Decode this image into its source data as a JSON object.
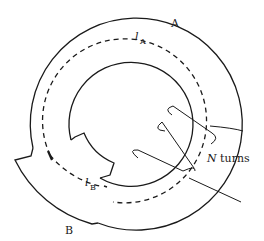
{
  "figure": {
    "type": "magnetic-circuit",
    "labels": {
      "region_a": "A",
      "region_b": "B",
      "path_a_symbol": "l",
      "path_a_sub": "A",
      "path_b_symbol": "l",
      "path_b_sub": "B",
      "coil_symbol": "N",
      "coil_text": " turns"
    }
  },
  "colors": {
    "stroke": "#1a1a1a",
    "background": "#ffffff"
  }
}
